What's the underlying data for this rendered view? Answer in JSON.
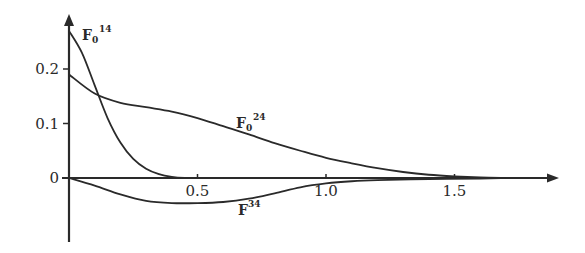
{
  "chart_data": {
    "type": "line",
    "title": "",
    "xlabel": "",
    "ylabel": "",
    "xlim": [
      0,
      1.85
    ],
    "ylim": [
      -0.1,
      0.28
    ],
    "grid": false,
    "legend": "inline labels",
    "x_ticks": [
      {
        "value": 0.5,
        "label": "0.5"
      },
      {
        "value": 1.0,
        "label": "1.0"
      },
      {
        "value": 1.5,
        "label": "1.5"
      }
    ],
    "y_ticks": [
      {
        "value": 0,
        "label": "0"
      },
      {
        "value": 0.1,
        "label": "0.1"
      },
      {
        "value": 0.2,
        "label": "0.2"
      }
    ],
    "series": [
      {
        "name": "F0^14",
        "label_main": "F",
        "label_sub": "0",
        "label_sup": "14",
        "x": [
          0.0,
          0.05,
          0.1,
          0.15,
          0.2,
          0.25,
          0.3,
          0.35,
          0.4,
          0.45,
          0.5,
          0.6
        ],
        "y": [
          0.27,
          0.23,
          0.17,
          0.11,
          0.065,
          0.035,
          0.017,
          0.007,
          0.002,
          0.0,
          0.0,
          0.0
        ]
      },
      {
        "name": "F0^24",
        "label_main": "F",
        "label_sub": "0",
        "label_sup": "24",
        "x": [
          0.0,
          0.1,
          0.2,
          0.3,
          0.4,
          0.5,
          0.6,
          0.7,
          0.8,
          0.9,
          1.0,
          1.1,
          1.2,
          1.3,
          1.4,
          1.5,
          1.6,
          1.7
        ],
        "y": [
          0.19,
          0.155,
          0.138,
          0.13,
          0.122,
          0.11,
          0.095,
          0.08,
          0.064,
          0.05,
          0.037,
          0.027,
          0.018,
          0.011,
          0.006,
          0.003,
          0.001,
          0.0
        ]
      },
      {
        "name": "F^34",
        "label_main": "F",
        "label_sub": "",
        "label_sup": "34",
        "x": [
          0.0,
          0.1,
          0.2,
          0.3,
          0.4,
          0.5,
          0.6,
          0.7,
          0.8,
          0.9,
          1.0,
          1.1,
          1.2,
          1.4,
          1.6,
          1.7
        ],
        "y": [
          0.0,
          -0.014,
          -0.03,
          -0.042,
          -0.046,
          -0.046,
          -0.044,
          -0.038,
          -0.028,
          -0.017,
          -0.01,
          -0.006,
          -0.004,
          -0.002,
          -0.001,
          0.0
        ]
      }
    ]
  }
}
